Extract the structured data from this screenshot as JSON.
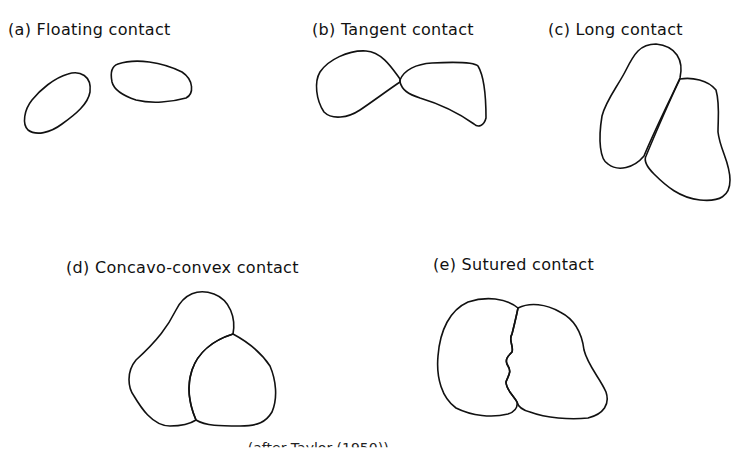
{
  "figure": {
    "panels": [
      {
        "id": "a",
        "label": "(a) Floating contact"
      },
      {
        "id": "b",
        "label": "(b) Tangent contact"
      },
      {
        "id": "c",
        "label": "(c) Long contact"
      },
      {
        "id": "d",
        "label": "(d) Concavo-convex contact"
      },
      {
        "id": "e",
        "label": "(e) Sutured contact"
      }
    ],
    "caption_partial": "... (after Taylor (1950))"
  }
}
